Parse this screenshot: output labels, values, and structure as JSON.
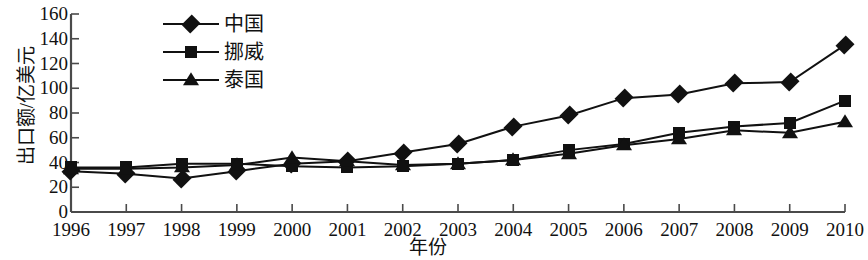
{
  "chart_data": {
    "type": "line",
    "title": "",
    "xlabel": "年份",
    "ylabel": "出口额/亿美元",
    "categories": [
      "1996",
      "1997",
      "1998",
      "1999",
      "2000",
      "2001",
      "2002",
      "2003",
      "2004",
      "2005",
      "2006",
      "2007",
      "2008",
      "2009",
      "2010"
    ],
    "xlim": [
      1996,
      2010
    ],
    "ylim": [
      0,
      160
    ],
    "yticks": [
      0,
      20,
      40,
      60,
      80,
      100,
      120,
      140,
      160
    ],
    "ytick_labels": [
      "0",
      "20",
      "40",
      "60",
      "80",
      "100",
      "120",
      "140",
      "160"
    ],
    "grid": false,
    "legend_position": "upper-left-inside",
    "series": [
      {
        "name": "中国",
        "marker": "diamond",
        "color": "#111111",
        "values": [
          33,
          31,
          27,
          33,
          39,
          41,
          48,
          55,
          69,
          78,
          92,
          95,
          104,
          105,
          135
        ]
      },
      {
        "name": "挪威",
        "marker": "square",
        "color": "#111111",
        "values": [
          36,
          36,
          39,
          39,
          37,
          36,
          37,
          39,
          42,
          50,
          55,
          64,
          69,
          72,
          90
        ]
      },
      {
        "name": "泰国",
        "marker": "triangle",
        "color": "#111111",
        "values": [
          35,
          35,
          36,
          38,
          44,
          41,
          38,
          39,
          42,
          47,
          54,
          59,
          66,
          64,
          73
        ]
      }
    ]
  },
  "axes": {
    "line_color": "#4a4a4a",
    "tick_color": "#4a4a4a"
  }
}
